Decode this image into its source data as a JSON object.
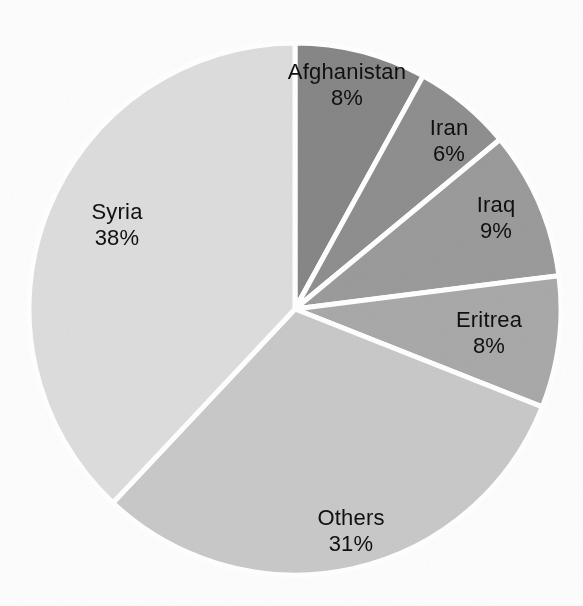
{
  "chart_data": {
    "type": "pie",
    "title": "",
    "subtitle": "",
    "xlabel": "",
    "ylabel": "",
    "legend_position": "none",
    "grid": false,
    "labels_inside": true,
    "start_angle_deg": 0,
    "direction": "clockwise",
    "categories": [
      "Afghanistan",
      "Iran",
      "Iraq",
      "Eritrea",
      "Others",
      "Syria"
    ],
    "values": [
      8,
      6,
      9,
      8,
      31,
      38
    ],
    "value_suffix": "%",
    "slices": [
      {
        "name": "Afghanistan",
        "value": 8,
        "value_label": "8%",
        "color": "#878787",
        "label_x": 347,
        "label_y": 85,
        "start_deg": 0.0,
        "end_deg": 28.8
      },
      {
        "name": "Iran",
        "value": 6,
        "value_label": "6%",
        "color": "#8f8f8f",
        "label_x": 449,
        "label_y": 141,
        "start_deg": 28.8,
        "end_deg": 50.4
      },
      {
        "name": "Iraq",
        "value": 9,
        "value_label": "9%",
        "color": "#9b9b9b",
        "label_x": 496,
        "label_y": 218,
        "start_deg": 50.4,
        "end_deg": 82.8
      },
      {
        "name": "Eritrea",
        "value": 8,
        "value_label": "8%",
        "color": "#a9a9a9",
        "label_x": 489,
        "label_y": 333,
        "start_deg": 82.8,
        "end_deg": 111.6
      },
      {
        "name": "Others",
        "value": 31,
        "value_label": "31%",
        "color": "#c9c9c9",
        "label_x": 351,
        "label_y": 531,
        "start_deg": 111.6,
        "end_deg": 223.2
      },
      {
        "name": "Syria",
        "value": 38,
        "value_label": "38%",
        "color": "#dddddd",
        "label_x": 117,
        "label_y": 225,
        "start_deg": 223.2,
        "end_deg": 360.0
      }
    ],
    "geometry": {
      "center_x": 295,
      "center_y": 309,
      "radius": 266,
      "separator_color": "#ffffff",
      "separator_width": 5
    },
    "colors": {
      "background": "#fdfdfd",
      "text": "#101010",
      "separator": "#ffffff"
    }
  }
}
